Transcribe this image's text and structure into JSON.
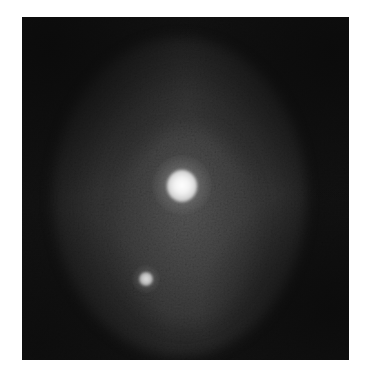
{
  "figure": {
    "alt": "Grayscale image of a diffuse oval glow with one large bright spot near center and one smaller bright spot below-left",
    "colors": {
      "background_page": "#ffffff",
      "image_dark": "#121212",
      "halo_gray": "#464646",
      "spot_bright": "#ffffff"
    },
    "features": [
      {
        "name": "large-bright-spot",
        "center": [
          182,
          185
        ],
        "radius": 15
      },
      {
        "name": "small-bright-spot",
        "center": [
          146,
          279
        ],
        "radius": 7
      }
    ]
  }
}
